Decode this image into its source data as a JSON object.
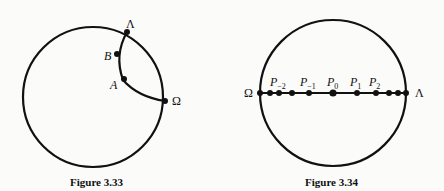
{
  "figures": [
    {
      "caption": "Figure 3.33",
      "points": [
        {
          "id": "Lambda",
          "label": "Λ",
          "italic": false
        },
        {
          "id": "B",
          "label": "B",
          "italic": true
        },
        {
          "id": "A",
          "label": "A",
          "italic": true
        },
        {
          "id": "Omega",
          "label": "Ω",
          "italic": false
        }
      ],
      "description": "Circle with a geodesic arc from Λ through B and A to Ω"
    },
    {
      "caption": "Figure 3.34",
      "endpoints": {
        "left": "Ω",
        "right": "Λ"
      },
      "points": [
        {
          "label": "P",
          "sub": "−2"
        },
        {
          "label": "P",
          "sub": "−1"
        },
        {
          "label": "P",
          "sub": "0"
        },
        {
          "label": "P",
          "sub": "1"
        },
        {
          "label": "P",
          "sub": "2"
        }
      ],
      "description": "Circle with horizontal diameter from Ω to Λ, points accumulating near both ends"
    }
  ]
}
